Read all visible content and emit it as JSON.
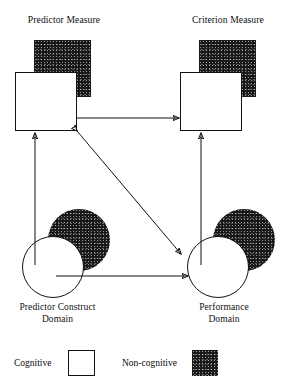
{
  "diagram": {
    "title_left": "Predictor Measure",
    "title_right": "Criterion Measure",
    "bottom_left": "Predictor Construct\nDomain",
    "bottom_right": "Performance\nDomain"
  },
  "legend": {
    "cognitive_label": "Cognitive",
    "noncognitive_label": "Non-cognitive",
    "cognitive_color": "#ffffff",
    "noncognitive_color": "#1b1b1b"
  },
  "nodes": {
    "predictor_measure_cognitive": "Cognitive predictor measure (white square)",
    "predictor_measure_noncognitive": "Non-cognitive predictor measure (dark square)",
    "criterion_measure_cognitive": "Cognitive criterion measure (white square)",
    "criterion_measure_noncognitive": "Non-cognitive criterion measure (dark square)",
    "predictor_construct_cognitive": "Cognitive predictor construct (white circle)",
    "predictor_construct_noncognitive": "Non-cognitive predictor construct (dark circle)",
    "performance_cognitive": "Cognitive performance domain (white circle)",
    "performance_noncognitive": "Non-cognitive performance domain (dark circle)"
  },
  "edges": {
    "measure_to_measure": "Predictor measure to criterion measure",
    "construct_to_measure": "Predictor construct to predictor measure",
    "performance_to_measure": "Performance domain to criterion measure",
    "construct_to_performance": "Predictor construct to performance domain",
    "measure_to_performance": "Predictor measure to performance domain (bidirectional)"
  }
}
